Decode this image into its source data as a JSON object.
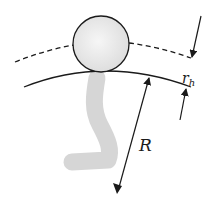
{
  "diagram": {
    "labels": {
      "R": "R",
      "r_main": "r",
      "r_sub": "h"
    },
    "colors": {
      "stroke": "#1a1a1a",
      "sphere_fill": "#ededed",
      "stem_fill": "#d4d4d4",
      "background": "#ffffff"
    },
    "elements": [
      "sphere",
      "dashed-arc",
      "solid-surface-arc",
      "stem",
      "radius-arrow-R",
      "height-arrows-r_h"
    ]
  }
}
